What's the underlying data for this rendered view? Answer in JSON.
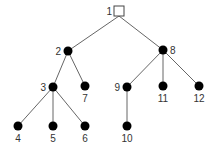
{
  "diagram": {
    "type": "tree",
    "root": "1",
    "colors": {
      "edge": "#666666",
      "node": "#000000",
      "root_fill": "#ffffff",
      "label": "#333333"
    },
    "nodes": [
      {
        "id": "1",
        "label": "1",
        "x": 119,
        "y": 11,
        "shape": "square",
        "label_pos": "left"
      },
      {
        "id": "2",
        "label": "2",
        "x": 68,
        "y": 51,
        "shape": "circle",
        "label_pos": "left"
      },
      {
        "id": "3",
        "label": "3",
        "x": 53,
        "y": 87,
        "shape": "circle",
        "label_pos": "left"
      },
      {
        "id": "4",
        "label": "4",
        "x": 18,
        "y": 126,
        "shape": "circle",
        "label_pos": "below"
      },
      {
        "id": "5",
        "label": "5",
        "x": 53,
        "y": 126,
        "shape": "circle",
        "label_pos": "below"
      },
      {
        "id": "6",
        "label": "6",
        "x": 85,
        "y": 126,
        "shape": "circle",
        "label_pos": "below"
      },
      {
        "id": "7",
        "label": "7",
        "x": 85,
        "y": 86,
        "shape": "circle",
        "label_pos": "below"
      },
      {
        "id": "8",
        "label": "8",
        "x": 163,
        "y": 50,
        "shape": "circle",
        "label_pos": "right"
      },
      {
        "id": "9",
        "label": "9",
        "x": 127,
        "y": 87,
        "shape": "circle",
        "label_pos": "left"
      },
      {
        "id": "10",
        "label": "10",
        "x": 127,
        "y": 126,
        "shape": "circle",
        "label_pos": "below"
      },
      {
        "id": "11",
        "label": "11",
        "x": 163,
        "y": 86,
        "shape": "circle",
        "label_pos": "below"
      },
      {
        "id": "12",
        "label": "12",
        "x": 199,
        "y": 86,
        "shape": "circle",
        "label_pos": "below"
      }
    ],
    "edges": [
      [
        "1",
        "2"
      ],
      [
        "1",
        "8"
      ],
      [
        "2",
        "3"
      ],
      [
        "2",
        "7"
      ],
      [
        "3",
        "4"
      ],
      [
        "3",
        "5"
      ],
      [
        "3",
        "6"
      ],
      [
        "8",
        "9"
      ],
      [
        "8",
        "11"
      ],
      [
        "8",
        "12"
      ],
      [
        "9",
        "10"
      ]
    ]
  }
}
